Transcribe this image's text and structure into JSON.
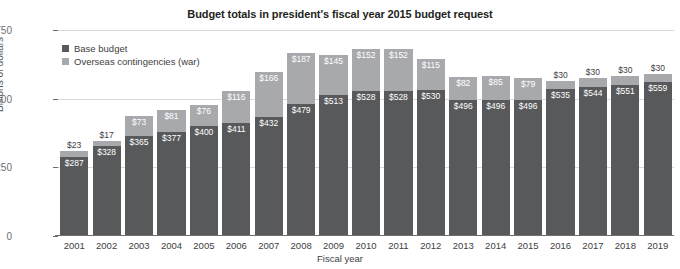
{
  "chart_data": {
    "type": "bar",
    "subtype": "stacked-bar",
    "title": "Budget totals in president's fiscal year 2015 budget request",
    "xlabel": "Fiscal year",
    "ylabel": "Billions of dollars",
    "ylim": [
      0,
      750
    ],
    "yticks": [
      0,
      250,
      500,
      750
    ],
    "ytick_labels": [
      "0",
      "250",
      "500",
      "750"
    ],
    "grid": true,
    "grid_axis": "y",
    "legend_position": "top-left",
    "categories": [
      "2001",
      "2002",
      "2003",
      "2004",
      "2005",
      "2006",
      "2007",
      "2008",
      "2009",
      "2010",
      "2011",
      "2012",
      "2013",
      "2014",
      "2015",
      "2016",
      "2017",
      "2018",
      "2019"
    ],
    "series": [
      {
        "name": "Base budget",
        "color": "#58595b",
        "values": [
          287,
          328,
          365,
          377,
          400,
          411,
          432,
          479,
          513,
          528,
          528,
          530,
          496,
          496,
          496,
          535,
          544,
          551,
          559
        ],
        "labels": [
          "$287",
          "$328",
          "$365",
          "$377",
          "$400",
          "$411",
          "$432",
          "$479",
          "$513",
          "$528",
          "$528",
          "$530",
          "$496",
          "$496",
          "$496",
          "$535",
          "$544",
          "$551",
          "$559"
        ]
      },
      {
        "name": "Overseas contingencies (war)",
        "color": "#a7a9ac",
        "values": [
          23,
          17,
          73,
          81,
          76,
          116,
          166,
          187,
          145,
          152,
          152,
          115,
          82,
          85,
          79,
          30,
          30,
          30,
          30
        ],
        "labels": [
          "$23",
          "$17",
          "$73",
          "$81",
          "$76",
          "$116",
          "$166",
          "$187",
          "$145",
          "$152",
          "$152",
          "$115",
          "$82",
          "$85",
          "$79",
          "$30",
          "$30",
          "$30",
          "$30"
        ]
      }
    ],
    "totals": [
      310,
      345,
      438,
      458,
      476,
      527,
      598,
      666,
      658,
      680,
      680,
      645,
      578,
      581,
      575,
      565,
      574,
      581,
      589
    ]
  },
  "legend": {
    "items": [
      {
        "label": "Base budget",
        "color": "#58595b"
      },
      {
        "label": "Overseas contingencies (war)",
        "color": "#a7a9ac"
      }
    ]
  }
}
